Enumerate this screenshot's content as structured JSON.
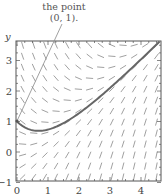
{
  "annotation": {
    "line1": "the point",
    "line2": "(0, 1).",
    "target": [
      0,
      1
    ]
  },
  "axes": {
    "ylabel": "y",
    "xticks": [
      "0",
      "1",
      "2",
      "3",
      "4"
    ],
    "yticks": [
      "3",
      "2",
      "1",
      "0",
      "−1"
    ]
  },
  "colors": {
    "frame": "#555555",
    "field": "#777777",
    "curve": "#666666",
    "annotation_line": "#888888"
  },
  "chart_data": {
    "type": "line",
    "title": "",
    "xlabel": "",
    "ylabel": "y",
    "xlim": [
      0,
      4.65
    ],
    "ylim": [
      -1,
      3.65
    ],
    "grid": false,
    "legend": null,
    "slope_field": {
      "equation": "dy/dx = x - y",
      "spacing": 0.36
    },
    "series": [
      {
        "name": "solution through (0,1)",
        "x": [
          0,
          0.25,
          0.5,
          0.69,
          1.0,
          1.5,
          2.0,
          2.5,
          3.0,
          3.5,
          4.0,
          4.5,
          4.65
        ],
        "y": [
          1.0,
          0.81,
          0.71,
          0.69,
          0.74,
          0.95,
          1.27,
          1.66,
          2.1,
          2.56,
          3.04,
          3.52,
          3.67
        ]
      }
    ],
    "annotations": [
      {
        "text": "the point (0, 1).",
        "x": 0,
        "y": 1
      }
    ]
  }
}
